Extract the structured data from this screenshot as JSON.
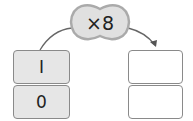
{
  "operator": {
    "symbol": "×",
    "value": "8",
    "label": "×8"
  },
  "input_boxes": [
    {
      "value": "I"
    },
    {
      "value": "0"
    }
  ],
  "output_boxes": [
    {
      "value": ""
    },
    {
      "value": ""
    }
  ],
  "colors": {
    "box_fill": "#e6e6e6",
    "border": "#8a8a8a",
    "blob_fill": "#e0e0e0"
  }
}
